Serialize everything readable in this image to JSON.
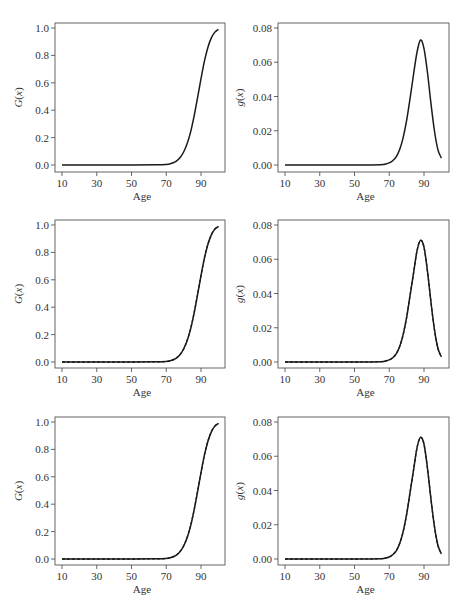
{
  "figure": {
    "layout": "3 rows x 2 columns",
    "colors": {
      "line": "#1a1a1a",
      "axis": "#555555",
      "background": "#ffffff"
    }
  },
  "labels": {
    "xlabel": "Age",
    "ylabel_left": "G(x)",
    "ylabel_right": "g(x)",
    "ylabel_left_italic": "G",
    "ylabel_right_italic": "g",
    "x_paren": "(x)",
    "x_ticks": [
      "10",
      "30",
      "50",
      "70",
      "90"
    ],
    "y_ticks_left": [
      "0.0",
      "0.2",
      "0.4",
      "0.6",
      "0.8",
      "1.0"
    ],
    "y_ticks_right": [
      "0.00",
      "0.02",
      "0.04",
      "0.06",
      "0.08"
    ]
  },
  "chart_data": [
    {
      "type": "line",
      "panel": "row1-left",
      "title": "",
      "xlabel": "Age",
      "ylabel": "G(x)",
      "xlim": [
        10,
        100
      ],
      "ylim": [
        0,
        1.0
      ],
      "x_ticks": [
        10,
        30,
        50,
        70,
        90
      ],
      "y_ticks": [
        0.0,
        0.2,
        0.4,
        0.6,
        0.8,
        1.0
      ],
      "grid": false,
      "series": [
        {
          "name": "fitted",
          "style": "solid",
          "x": [
            10,
            30,
            50,
            65,
            70,
            72,
            74,
            76,
            78,
            80,
            82,
            84,
            86,
            88,
            90,
            92,
            94,
            96,
            98,
            100
          ],
          "values": [
            0,
            0,
            0,
            0.001,
            0.004,
            0.008,
            0.016,
            0.03,
            0.055,
            0.095,
            0.155,
            0.24,
            0.355,
            0.49,
            0.63,
            0.76,
            0.86,
            0.93,
            0.97,
            0.99
          ]
        }
      ]
    },
    {
      "type": "line",
      "panel": "row1-right",
      "title": "",
      "xlabel": "Age",
      "ylabel": "g(x)",
      "xlim": [
        10,
        100
      ],
      "ylim": [
        0,
        0.08
      ],
      "x_ticks": [
        10,
        30,
        50,
        70,
        90
      ],
      "y_ticks": [
        0.0,
        0.02,
        0.04,
        0.06,
        0.08
      ],
      "grid": false,
      "series": [
        {
          "name": "fitted",
          "style": "solid",
          "x": [
            10,
            30,
            50,
            65,
            68,
            70,
            72,
            74,
            76,
            78,
            80,
            82,
            84,
            86,
            88,
            90,
            92,
            94,
            96,
            98,
            100
          ],
          "values": [
            0,
            0,
            0,
            0.0002,
            0.0006,
            0.0012,
            0.0025,
            0.0048,
            0.009,
            0.016,
            0.026,
            0.039,
            0.053,
            0.066,
            0.073,
            0.068,
            0.054,
            0.036,
            0.02,
            0.009,
            0.004
          ]
        }
      ]
    },
    {
      "type": "line",
      "panel": "row2-left",
      "title": "",
      "xlabel": "Age",
      "ylabel": "G(x)",
      "xlim": [
        10,
        100
      ],
      "ylim": [
        0,
        1.0
      ],
      "x_ticks": [
        10,
        30,
        50,
        70,
        90
      ],
      "y_ticks": [
        0.0,
        0.2,
        0.4,
        0.6,
        0.8,
        1.0
      ],
      "grid": false,
      "series": [
        {
          "name": "fitted",
          "style": "solid",
          "x": [
            10,
            30,
            50,
            65,
            70,
            72,
            74,
            76,
            78,
            80,
            82,
            84,
            86,
            88,
            90,
            92,
            94,
            96,
            98,
            100
          ],
          "values": [
            0,
            0,
            0,
            0.001,
            0.004,
            0.008,
            0.016,
            0.03,
            0.055,
            0.095,
            0.155,
            0.24,
            0.355,
            0.49,
            0.63,
            0.76,
            0.86,
            0.93,
            0.97,
            0.99
          ]
        },
        {
          "name": "estimate",
          "style": "dashed",
          "x": [
            10,
            30,
            50,
            65,
            70,
            72,
            74,
            76,
            78,
            80,
            82,
            84,
            86,
            88,
            90,
            92,
            94,
            96,
            98,
            100
          ],
          "values": [
            0,
            0,
            0,
            0.001,
            0.004,
            0.008,
            0.016,
            0.031,
            0.056,
            0.096,
            0.157,
            0.242,
            0.357,
            0.492,
            0.632,
            0.762,
            0.862,
            0.931,
            0.971,
            0.99
          ]
        }
      ]
    },
    {
      "type": "line",
      "panel": "row2-right",
      "title": "",
      "xlabel": "Age",
      "ylabel": "g(x)",
      "xlim": [
        10,
        100
      ],
      "ylim": [
        0,
        0.08
      ],
      "x_ticks": [
        10,
        30,
        50,
        70,
        90
      ],
      "y_ticks": [
        0.0,
        0.02,
        0.04,
        0.06,
        0.08
      ],
      "grid": false,
      "series": [
        {
          "name": "fitted",
          "style": "solid",
          "x": [
            10,
            30,
            50,
            65,
            68,
            70,
            72,
            74,
            76,
            78,
            80,
            82,
            84,
            86,
            88,
            90,
            92,
            94,
            96,
            98,
            100
          ],
          "values": [
            0,
            0,
            0,
            0.0002,
            0.0006,
            0.0012,
            0.0025,
            0.0048,
            0.009,
            0.016,
            0.026,
            0.039,
            0.052,
            0.065,
            0.071,
            0.067,
            0.053,
            0.035,
            0.019,
            0.008,
            0.003
          ]
        },
        {
          "name": "estimate",
          "style": "dashed",
          "x": [
            10,
            30,
            50,
            65,
            68,
            70,
            72,
            74,
            76,
            78,
            80,
            82,
            84,
            86,
            88,
            90,
            92,
            94,
            96,
            98,
            100
          ],
          "values": [
            0,
            0,
            0,
            0.0002,
            0.0006,
            0.0012,
            0.0025,
            0.0048,
            0.009,
            0.016,
            0.026,
            0.039,
            0.052,
            0.065,
            0.071,
            0.067,
            0.053,
            0.035,
            0.019,
            0.008,
            0.003
          ]
        }
      ]
    },
    {
      "type": "line",
      "panel": "row3-left",
      "title": "",
      "xlabel": "Age",
      "ylabel": "G(x)",
      "xlim": [
        10,
        100
      ],
      "ylim": [
        0,
        1.0
      ],
      "x_ticks": [
        10,
        30,
        50,
        70,
        90
      ],
      "y_ticks": [
        0.0,
        0.2,
        0.4,
        0.6,
        0.8,
        1.0
      ],
      "grid": false,
      "series": [
        {
          "name": "fitted",
          "style": "solid",
          "x": [
            10,
            30,
            50,
            65,
            70,
            72,
            74,
            76,
            78,
            80,
            82,
            84,
            86,
            88,
            90,
            92,
            94,
            96,
            98,
            100
          ],
          "values": [
            0,
            0,
            0,
            0.001,
            0.004,
            0.008,
            0.016,
            0.03,
            0.055,
            0.095,
            0.155,
            0.24,
            0.355,
            0.49,
            0.63,
            0.76,
            0.86,
            0.93,
            0.97,
            0.99
          ]
        },
        {
          "name": "estimate",
          "style": "dashed",
          "x": [
            10,
            30,
            50,
            65,
            70,
            72,
            74,
            76,
            78,
            80,
            82,
            84,
            86,
            88,
            90,
            92,
            94,
            96,
            98,
            100
          ],
          "values": [
            0,
            0,
            0,
            0.001,
            0.004,
            0.008,
            0.016,
            0.031,
            0.056,
            0.096,
            0.157,
            0.242,
            0.357,
            0.492,
            0.632,
            0.762,
            0.862,
            0.931,
            0.971,
            0.99
          ]
        }
      ]
    },
    {
      "type": "line",
      "panel": "row3-right",
      "title": "",
      "xlabel": "Age",
      "ylabel": "g(x)",
      "xlim": [
        10,
        100
      ],
      "ylim": [
        0,
        0.08
      ],
      "x_ticks": [
        10,
        30,
        50,
        70,
        90
      ],
      "y_ticks": [
        0.0,
        0.02,
        0.04,
        0.06,
        0.08
      ],
      "grid": false,
      "series": [
        {
          "name": "fitted",
          "style": "solid",
          "x": [
            10,
            30,
            50,
            65,
            68,
            70,
            72,
            74,
            76,
            78,
            80,
            82,
            84,
            86,
            88,
            90,
            92,
            94,
            96,
            98,
            100
          ],
          "values": [
            0,
            0,
            0,
            0.0002,
            0.0006,
            0.0012,
            0.0025,
            0.0048,
            0.009,
            0.016,
            0.026,
            0.039,
            0.052,
            0.065,
            0.071,
            0.067,
            0.053,
            0.035,
            0.019,
            0.008,
            0.003
          ]
        },
        {
          "name": "estimate",
          "style": "dashed",
          "x": [
            10,
            30,
            50,
            65,
            68,
            70,
            72,
            74,
            76,
            78,
            80,
            82,
            84,
            86,
            88,
            90,
            92,
            94,
            96,
            98,
            100
          ],
          "values": [
            0,
            0,
            0,
            0.0002,
            0.0006,
            0.0012,
            0.0025,
            0.0048,
            0.009,
            0.016,
            0.026,
            0.039,
            0.052,
            0.065,
            0.071,
            0.067,
            0.053,
            0.035,
            0.019,
            0.008,
            0.003
          ]
        }
      ]
    }
  ]
}
